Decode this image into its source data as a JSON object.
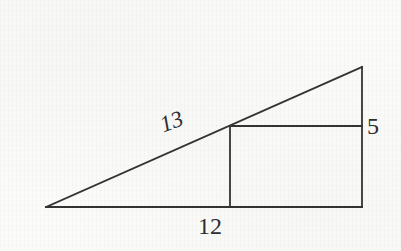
{
  "figure": {
    "kind": "geometry-diagram",
    "background_color": "#fbfbfa",
    "stroke_color": "#333333",
    "text_color": "#2e2e2e",
    "stroke_width": 1.6,
    "canvas": {
      "width": 401,
      "height": 251
    },
    "points": {
      "left_apex": {
        "x": 46,
        "y": 207
      },
      "bottom_right": {
        "x": 362,
        "y": 207
      },
      "top_right": {
        "x": 362,
        "y": 67
      },
      "rect_top_left": {
        "x": 230,
        "y": 126
      },
      "rect_top_right": {
        "x": 362,
        "y": 126
      },
      "rect_bottom_left": {
        "x": 230,
        "y": 207
      }
    },
    "segments": [
      {
        "name": "baseline",
        "from": "left_apex",
        "to": "bottom_right"
      },
      {
        "name": "hypotenuse",
        "from": "left_apex",
        "to": "top_right"
      },
      {
        "name": "right-side",
        "from": "top_right",
        "to": "bottom_right"
      },
      {
        "name": "rectangle-top",
        "from": "rect_top_left",
        "to": "rect_top_right"
      },
      {
        "name": "rectangle-left",
        "from": "rect_top_left",
        "to": "rect_bottom_left"
      }
    ],
    "labels": {
      "hypotenuse": "13",
      "base": "12",
      "height": "5"
    }
  }
}
